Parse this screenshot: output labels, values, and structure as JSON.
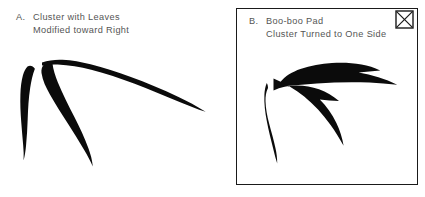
{
  "figure": {
    "background_color": "#ffffff",
    "ink_color": "#0b0b0b",
    "caption_color": "#555555",
    "border_color": "#1a1a1a"
  },
  "panels": [
    {
      "id": "a",
      "letter": "A.",
      "caption_line_1": "Cluster with Leaves",
      "caption_line_2": "Modified toward Right",
      "bordered": false,
      "leaf_count": 3,
      "leaves": [
        {
          "name": "left-descending-leaf",
          "direction": "down-left"
        },
        {
          "name": "center-descending-leaf",
          "direction": "down-right"
        },
        {
          "name": "right-extending-leaf",
          "direction": "right"
        }
      ]
    },
    {
      "id": "b",
      "letter": "B.",
      "caption_line_1": "Boo-boo Pad",
      "caption_line_2": "Cluster Turned to One Side",
      "bordered": true,
      "leaf_count": 3,
      "leaves": [
        {
          "name": "upper-horizontal-leaf",
          "direction": "right"
        },
        {
          "name": "middle-diagonal-leaf",
          "direction": "down-right"
        },
        {
          "name": "lower-vertical-leaf",
          "direction": "down"
        }
      ]
    }
  ],
  "icons": {
    "close_box": "x-box-icon"
  }
}
